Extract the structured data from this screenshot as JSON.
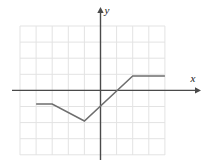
{
  "chart_data": {
    "type": "line",
    "title": "",
    "xlabel": "x",
    "ylabel": "y",
    "grid": true,
    "legend": null,
    "axis_arrows": true,
    "xlim": [
      -5,
      4
    ],
    "ylim": [
      -4,
      4
    ],
    "xticks": [
      -5,
      -4,
      -3,
      -2,
      -1,
      0,
      1,
      2,
      3,
      4
    ],
    "yticks": [
      -4,
      -3,
      -2,
      -1,
      0,
      1,
      2,
      3,
      4
    ],
    "tick_labels_visible": false,
    "series": [
      {
        "name": "piecewise-linear-function",
        "color": "#6e6e6e",
        "points": [
          {
            "x": -4,
            "y": -0.85
          },
          {
            "x": -3,
            "y": -0.85
          },
          {
            "x": -1,
            "y": -1.9
          },
          {
            "x": 2,
            "y": 0.9
          },
          {
            "x": 4,
            "y": 0.9
          }
        ]
      }
    ],
    "annotations": [
      {
        "text": "y",
        "x_px": 107,
        "y_px": 14,
        "style": "italic"
      },
      {
        "text": "x",
        "x_px": 193,
        "y_px": 82,
        "style": "italic"
      }
    ]
  },
  "colors": {
    "grid": "#e3e3e3",
    "axis": "#4a4a4a",
    "curve": "#6e6e6e",
    "background": "#ffffff",
    "label": "#1a1a1a"
  },
  "geometry": {
    "grid_left_px": 20,
    "grid_right_px": 165,
    "grid_top_px": 26,
    "grid_bottom_px": 155,
    "cell_px": 16.1,
    "origin_x_px": 100.5,
    "origin_y_px": 90.4,
    "x_axis_arrow_tip_px": 198,
    "y_axis_arrow_tip_px": 10
  }
}
